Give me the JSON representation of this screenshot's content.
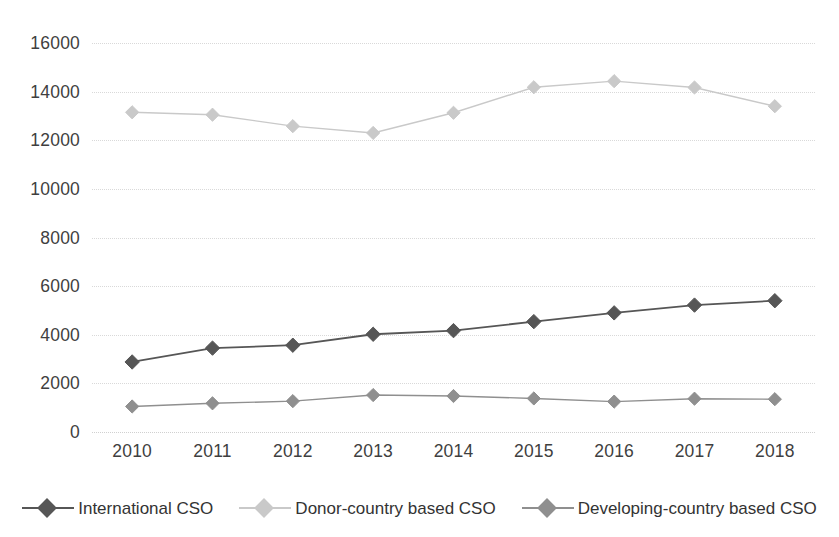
{
  "chart_data": {
    "type": "line",
    "title": "",
    "subtitle": "",
    "xlabel": "",
    "ylabel": "",
    "categories": [
      "2010",
      "2011",
      "2012",
      "2013",
      "2014",
      "2015",
      "2016",
      "2017",
      "2018"
    ],
    "ylim": [
      0,
      16000
    ],
    "ytick_labels": [
      "0",
      "2000",
      "4000",
      "6000",
      "8000",
      "10000",
      "12000",
      "14000",
      "16000"
    ],
    "ytick_values": [
      0,
      2000,
      4000,
      6000,
      8000,
      10000,
      12000,
      14000,
      16000
    ],
    "grid": true,
    "grid_axis": "y",
    "legend_position": "bottom",
    "series": [
      {
        "name": "International CSO",
        "color": "#565656",
        "marker": "diamond",
        "values": [
          2880,
          3450,
          3570,
          4020,
          4170,
          4540,
          4900,
          5220,
          5400
        ]
      },
      {
        "name": "Donor-country based CSO",
        "color": "#c9c9c9",
        "marker": "diamond",
        "values": [
          13150,
          13050,
          12580,
          12300,
          13130,
          14180,
          14430,
          14170,
          13400
        ]
      },
      {
        "name": "Developing-country based CSO",
        "color": "#8f8f8f",
        "marker": "diamond",
        "values": [
          1050,
          1180,
          1270,
          1520,
          1480,
          1380,
          1250,
          1370,
          1350
        ]
      }
    ]
  },
  "legend": {
    "entries": [
      {
        "label": "International CSO",
        "color": "#565656"
      },
      {
        "label": "Donor-country based CSO",
        "color": "#c9c9c9"
      },
      {
        "label": "Developing-country based CSO",
        "color": "#8f8f8f"
      }
    ]
  },
  "axes": {
    "y_ticks": [
      "16000",
      "14000",
      "12000",
      "10000",
      "8000",
      "6000",
      "4000",
      "2000",
      "0"
    ],
    "x_ticks": [
      "2010",
      "2011",
      "2012",
      "2013",
      "2014",
      "2015",
      "2016",
      "2017",
      "2018"
    ]
  },
  "colors": {
    "gridline": "#d9d9d9",
    "text": "#3f3f3f",
    "background": "#ffffff"
  }
}
